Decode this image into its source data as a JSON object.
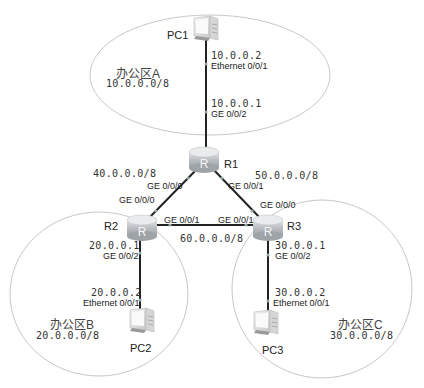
{
  "zones": [
    {
      "id": "A",
      "name": "办公区A",
      "network": "10.0.0.0/8"
    },
    {
      "id": "B",
      "name": "办公区B",
      "network": "20.0.0.0/8"
    },
    {
      "id": "C",
      "name": "办公区C",
      "network": "30.0.0.0/8"
    }
  ],
  "devices": {
    "pc1": "PC1",
    "pc2": "PC2",
    "pc3": "PC3",
    "r1": "R1",
    "r2": "R2",
    "r3": "R3"
  },
  "interfaces": {
    "pc1_eth": {
      "ip": "10.0.0.2",
      "name": "Ethernet 0/0/1"
    },
    "r1_ge002": {
      "ip": "10.0.0.1",
      "name": "GE 0/0/2"
    },
    "r1_ge000": "GE 0/0/0",
    "r1_ge001": "GE 0/0/1",
    "r2_ge000": "GE 0/0/0",
    "r2_ge001": "GE 0/0/1",
    "r2_ge002": {
      "ip": "20.0.0.1",
      "name": "GE 0/0/2"
    },
    "pc2_eth": {
      "ip": "20.0.0.2",
      "name": "Ethernet 0/0/1"
    },
    "r3_ge000": "GE 0/0/0",
    "r3_ge001": "GE 0/0/1",
    "r3_ge002": {
      "ip": "30.0.0.1",
      "name": "GE 0/0/2"
    },
    "pc3_eth": {
      "ip": "30.0.0.2",
      "name": "Ethernet 0/0/1"
    }
  },
  "links": {
    "r1_r2": "40.0.0.0/8",
    "r1_r3": "50.0.0.0/8",
    "r2_r3": "60.0.0.0/8"
  }
}
